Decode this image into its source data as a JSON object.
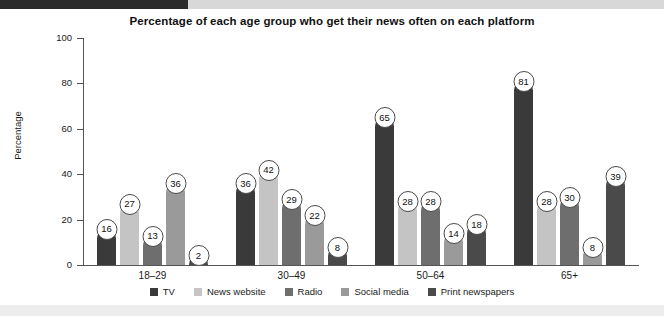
{
  "chart_data": {
    "type": "bar",
    "title": "Percentage of each age group who get their news often on each platform",
    "xlabel": "",
    "ylabel": "Percentage",
    "ylim": [
      0,
      100
    ],
    "yticks": [
      0,
      20,
      40,
      60,
      80,
      100
    ],
    "grid": false,
    "legend_position": "bottom",
    "categories": [
      "18–29",
      "30–49",
      "50–64",
      "65+"
    ],
    "series": [
      {
        "name": "TV",
        "color": "#3a3a3a",
        "values": [
          16,
          36,
          65,
          81
        ]
      },
      {
        "name": "News website",
        "color": "#c4c4c4",
        "values": [
          27,
          42,
          28,
          28
        ]
      },
      {
        "name": "Radio",
        "color": "#6e6e6e",
        "values": [
          13,
          29,
          28,
          30
        ]
      },
      {
        "name": "Social media",
        "color": "#9a9a9a",
        "values": [
          36,
          22,
          14,
          8
        ]
      },
      {
        "name": "Print newspapers",
        "color": "#4a4a4a",
        "values": [
          2,
          8,
          18,
          39
        ]
      }
    ]
  },
  "axis": {
    "y_labels": [
      "100",
      "80",
      "60",
      "40",
      "20",
      "0"
    ],
    "y_title": "Percentage"
  },
  "legend": {
    "items": [
      {
        "label": "TV"
      },
      {
        "label": "News website"
      },
      {
        "label": "Radio"
      },
      {
        "label": "Social media"
      },
      {
        "label": "Print newspapers"
      }
    ]
  }
}
